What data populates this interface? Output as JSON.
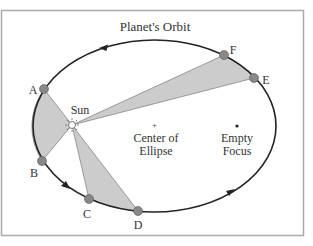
{
  "title": "Planet's Orbit",
  "labels": {
    "sun": "Sun",
    "center_line1": "Center of",
    "center_line2": "Ellipse",
    "focus_line1": "Empty",
    "focus_line2": "Focus"
  },
  "points": [
    {
      "id": "A",
      "label": "A"
    },
    {
      "id": "B",
      "label": "B"
    },
    {
      "id": "C",
      "label": "C"
    },
    {
      "id": "D",
      "label": "D"
    },
    {
      "id": "E",
      "label": "E"
    },
    {
      "id": "F",
      "label": "F"
    }
  ],
  "colors": {
    "frame": "#aaaaaa",
    "orbit": "#222222",
    "sector_fill": "#cccccc",
    "point_fill": "#888888",
    "text": "#333333"
  },
  "sectors": [
    {
      "name": "sector-A-B",
      "from": "A",
      "to": "B"
    },
    {
      "name": "sector-C-D",
      "from": "C",
      "to": "D"
    },
    {
      "name": "sector-E-F",
      "from": "E",
      "to": "F"
    }
  ]
}
